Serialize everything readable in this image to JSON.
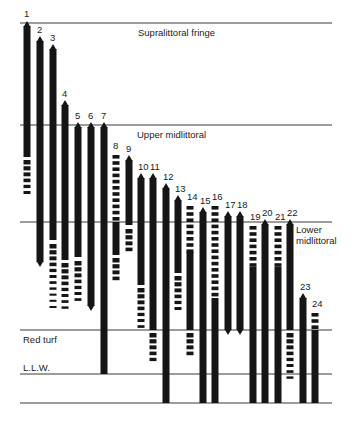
{
  "diagram": {
    "zones": [
      {
        "id": "supralittoral",
        "label": "Supralittoral fringe",
        "line_y": 23,
        "label_x": 138,
        "label_y": 36
      },
      {
        "id": "upper-midlittoral",
        "label": "Upper midlittoral",
        "line_y": 125,
        "label_x": 137,
        "label_y": 138
      },
      {
        "id": "lower-midlittoral",
        "label_lines": [
          "Lower",
          "midlittoral"
        ],
        "line_y": 222,
        "label_x": 296,
        "label_y": 233
      },
      {
        "id": "red-turf",
        "label": "Red turf",
        "line_y": 330,
        "label_x": 23,
        "label_y": 343
      },
      {
        "id": "llw",
        "label": "L.L.W.",
        "line_y": 374,
        "label_x": 23,
        "label_y": 371
      },
      {
        "id": "bottom",
        "label": "",
        "line_y": 403
      }
    ],
    "line_extent": {
      "x1": 20,
      "x2": 332
    },
    "species": [
      {
        "n": "1",
        "x": 27,
        "top": 23,
        "segments": [
          {
            "t": "solid",
            "y1": 26,
            "y2": 157
          }
        ],
        "dashes": {
          "y1": 160,
          "y2": 192
        }
      },
      {
        "n": "2",
        "x": 40,
        "top": 39,
        "segments": [
          {
            "t": "solid",
            "y1": 41,
            "y2": 262
          }
        ],
        "dashes": null
      },
      {
        "n": "3",
        "x": 53,
        "top": 47,
        "segments": [
          {
            "t": "solid",
            "y1": 49,
            "y2": 240
          }
        ],
        "dashes": {
          "y1": 244,
          "y2": 310
        }
      },
      {
        "n": "4",
        "x": 65,
        "top": 103,
        "segments": [
          {
            "t": "solid",
            "y1": 105,
            "y2": 260
          }
        ],
        "dashes": {
          "y1": 263,
          "y2": 310
        }
      },
      {
        "n": "5",
        "x": 78,
        "top": 125,
        "segments": [
          {
            "t": "solid",
            "y1": 127,
            "y2": 257
          }
        ],
        "dashes": {
          "y1": 261,
          "y2": 303
        }
      },
      {
        "n": "6",
        "x": 91,
        "top": 125,
        "segments": [
          {
            "t": "solid",
            "y1": 127,
            "y2": 306
          }
        ],
        "dashes": null
      },
      {
        "n": "7",
        "x": 104,
        "top": 125,
        "segments": [
          {
            "t": "solid",
            "y1": 127,
            "y2": 374
          }
        ],
        "dashes": null
      },
      {
        "n": "8",
        "x": 116,
        "top": 155,
        "dashes_first": {
          "y1": 155,
          "y2": 220
        },
        "segments": [
          {
            "t": "solid",
            "y1": 222,
            "y2": 255
          }
        ],
        "dashes": {
          "y1": 258,
          "y2": 278
        }
      },
      {
        "n": "9",
        "x": 129,
        "top": 158,
        "segments": [
          {
            "t": "solid",
            "y1": 160,
            "y2": 225
          }
        ],
        "dashes": {
          "y1": 229,
          "y2": 250
        }
      },
      {
        "n": "10",
        "x": 141,
        "top": 176,
        "segments": [
          {
            "t": "solid",
            "y1": 178,
            "y2": 285
          }
        ],
        "dashes": {
          "y1": 288,
          "y2": 328
        }
      },
      {
        "n": "11",
        "x": 153,
        "top": 176,
        "segments": [
          {
            "t": "solid",
            "y1": 178,
            "y2": 330
          }
        ],
        "dashes": {
          "y1": 333,
          "y2": 362
        }
      },
      {
        "n": "12",
        "x": 166,
        "top": 186,
        "segments": [
          {
            "t": "solid",
            "y1": 188,
            "y2": 403
          }
        ],
        "dashes": null
      },
      {
        "n": "13",
        "x": 178,
        "top": 198,
        "segments": [
          {
            "t": "solid",
            "y1": 200,
            "y2": 273
          }
        ],
        "dashes": {
          "y1": 276,
          "y2": 307
        }
      },
      {
        "n": "14",
        "x": 190,
        "top": 206,
        "dashes_first": {
          "y1": 206,
          "y2": 250
        },
        "segments": [
          {
            "t": "solid",
            "y1": 252,
            "y2": 330
          }
        ],
        "dashes": {
          "y1": 333,
          "y2": 355
        }
      },
      {
        "n": "15",
        "x": 203,
        "top": 210,
        "segments": [
          {
            "t": "solid",
            "y1": 212,
            "y2": 403
          }
        ],
        "dashes": null
      },
      {
        "n": "16",
        "x": 215,
        "top": 206,
        "dashes_first": {
          "y1": 206,
          "y2": 296
        },
        "segments": [
          {
            "t": "solid",
            "y1": 298,
            "y2": 403
          }
        ],
        "dashes": null
      },
      {
        "n": "17",
        "x": 228,
        "top": 214,
        "segments": [
          {
            "t": "solid",
            "y1": 216,
            "y2": 330
          }
        ],
        "dashes": null
      },
      {
        "n": "18",
        "x": 240,
        "top": 214,
        "segments": [
          {
            "t": "solid",
            "y1": 216,
            "y2": 330
          }
        ],
        "dashes": null
      },
      {
        "n": "19",
        "x": 253,
        "top": 226,
        "dashes_first": {
          "y1": 226,
          "y2": 265
        },
        "segments": [
          {
            "t": "solid",
            "y1": 267,
            "y2": 403
          }
        ],
        "dashes": null
      },
      {
        "n": "20",
        "x": 265,
        "top": 222,
        "segments": [
          {
            "t": "solid",
            "y1": 224,
            "y2": 403
          }
        ],
        "dashes": null
      },
      {
        "n": "21",
        "x": 278,
        "top": 226,
        "dashes_first": {
          "y1": 226,
          "y2": 265
        },
        "segments": [
          {
            "t": "solid",
            "y1": 267,
            "y2": 403
          }
        ],
        "dashes": null
      },
      {
        "n": "22",
        "x": 290,
        "top": 222,
        "segments": [
          {
            "t": "solid",
            "y1": 224,
            "y2": 330
          }
        ],
        "dashes": {
          "y1": 333,
          "y2": 382
        }
      },
      {
        "n": "23",
        "x": 303,
        "top": 296,
        "segments": [
          {
            "t": "solid",
            "y1": 298,
            "y2": 403
          }
        ],
        "dashes": null
      },
      {
        "n": "24",
        "x": 315,
        "top": 313,
        "dashes_first": {
          "y1": 313,
          "y2": 328
        },
        "segments": [
          {
            "t": "solid",
            "y1": 330,
            "y2": 403
          }
        ],
        "dashes": null
      }
    ],
    "colors": {
      "bar": "#151515",
      "line": "#3a3a3a",
      "text": "#222222",
      "background": "#ffffff"
    }
  }
}
